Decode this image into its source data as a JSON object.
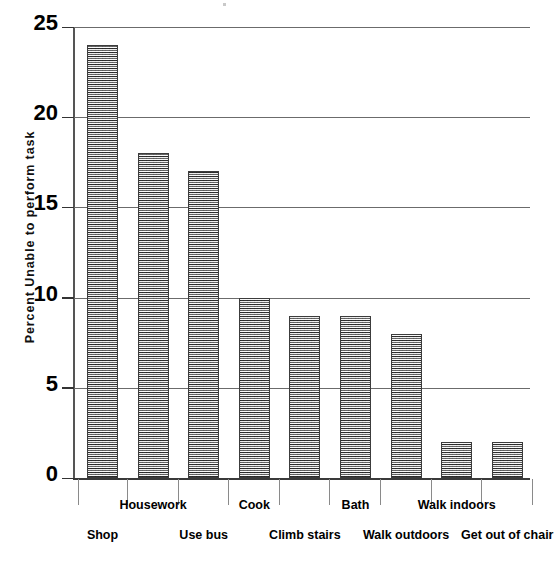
{
  "chart_data": {
    "type": "bar",
    "title": "",
    "subtitle": "",
    "xlabel": "",
    "ylabel": "Percent Unable to perform task",
    "categories": [
      "Shop",
      "Housework",
      "Use bus",
      "Cook",
      "Climb stairs",
      "Bath",
      "Walk outdoors",
      "Walk indoors",
      "Get out of chair"
    ],
    "values": [
      24,
      18,
      17,
      10,
      9,
      9,
      8,
      2,
      2
    ],
    "ylim": [
      0,
      25
    ],
    "ytick_labels": [
      "0",
      "5",
      "10",
      "15",
      "20",
      "25"
    ],
    "ytick_values": [
      0,
      5,
      10,
      15,
      20,
      25
    ],
    "grid": "horizontal",
    "legend": "none",
    "bar_fill": "#b9b9b9",
    "bar_edge": "#3c3c3c",
    "gridline_color": "#6b6b6b",
    "axis_color": "#333333",
    "background": "#ffffff"
  },
  "axis": {
    "y_title": "Percent Unable to perform task"
  }
}
